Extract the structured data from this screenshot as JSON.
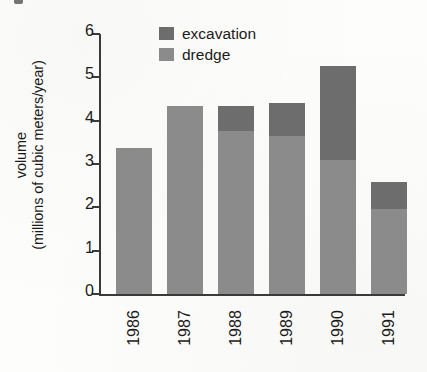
{
  "chart_data": {
    "type": "bar",
    "subtype": "stacked-vertical",
    "title": "",
    "xlabel": "",
    "ylabel": "volume (millions of cubic meters/year)",
    "ylabel_lines": [
      "volume",
      "(millions of cubic meters/year)"
    ],
    "categories": [
      "1986",
      "1987",
      "1988",
      "1989",
      "1990",
      "1991"
    ],
    "series": [
      {
        "name": "dredge",
        "color": "#8b8b8b",
        "values": [
          3.38,
          4.33,
          3.77,
          3.64,
          3.1,
          1.97
        ]
      },
      {
        "name": "excavation",
        "color": "#6d6d6d",
        "values": [
          0.0,
          0.0,
          0.56,
          0.76,
          2.17,
          0.61
        ]
      }
    ],
    "totals": [
      3.38,
      4.33,
      4.33,
      4.4,
      5.27,
      2.58
    ],
    "ylim": [
      0,
      6
    ],
    "yticks": [
      0,
      1,
      2,
      3,
      4,
      5,
      6
    ],
    "ytick_labels": [
      "0",
      "1",
      "2",
      "3",
      "4",
      "5",
      "6"
    ],
    "grid": false,
    "legend_position": "top-center",
    "legend_order": [
      "excavation",
      "dredge"
    ],
    "xtick_rotation": 90,
    "stack_order_bottom_to_top": [
      "dredge",
      "excavation"
    ]
  },
  "legend": {
    "items": [
      {
        "label": "excavation",
        "color": "#6d6d6d"
      },
      {
        "label": "dredge",
        "color": "#8b8b8b"
      }
    ]
  },
  "axes": {
    "y_title_line1": "volume",
    "y_title_line2": "(millions of cubic meters/year)",
    "y_tick_labels": [
      "6",
      "5",
      "4",
      "3",
      "2",
      "1",
      "0"
    ],
    "x_tick_labels": [
      "1986",
      "1987",
      "1988",
      "1989",
      "1990",
      "1991"
    ]
  },
  "colors": {
    "excavation": "#6d6d6d",
    "dredge": "#8b8b8b",
    "axis": "#3a3a3a",
    "text": "#1b1b1b",
    "background": "#fdfdfb"
  }
}
